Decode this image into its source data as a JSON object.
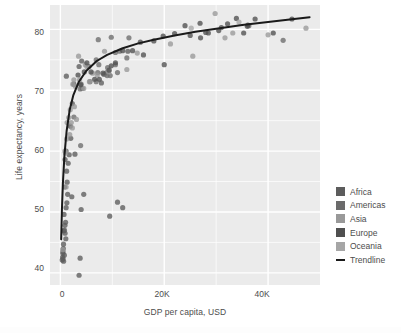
{
  "chart_data": {
    "type": "scatter",
    "title": "",
    "xlabel": "GDP per capita, USD",
    "ylabel": "Life expectancy, years",
    "xlim": [
      -2000,
      50000
    ],
    "ylim": [
      38,
      84
    ],
    "xticks": [
      "0",
      "20K",
      "40K"
    ],
    "xtickvalues": [
      0,
      20000,
      40000
    ],
    "yticks": [
      "40",
      "50",
      "60",
      "70",
      "80"
    ],
    "ytickvalues": [
      40,
      50,
      60,
      70,
      80
    ],
    "grid": true,
    "legend_position": "right",
    "panel_background": "#ebebeb",
    "gridline_color": "#ffffff",
    "point_color": "#595959",
    "trendline_color": "#1a1a1a",
    "series": [
      {
        "name": "Africa",
        "color": "#5c5c5c",
        "points": [
          [
            1150,
            72.3
          ],
          [
            3600,
            73.9
          ],
          [
            1200,
            56.7
          ],
          [
            1100,
            50.7
          ],
          [
            1400,
            52.9
          ],
          [
            900,
            46.5
          ],
          [
            4000,
            50.4
          ],
          [
            2200,
            52.5
          ],
          [
            700,
            49.6
          ],
          [
            600,
            44.7
          ],
          [
            1000,
            48.3
          ],
          [
            820,
            54.1
          ],
          [
            430,
            42.6
          ],
          [
            1500,
            58.0
          ],
          [
            640,
            46.9
          ],
          [
            350,
            42.1
          ],
          [
            500,
            43.5
          ],
          [
            1700,
            59.4
          ],
          [
            12000,
            50.7
          ],
          [
            11000,
            51.6
          ],
          [
            2800,
            59.5
          ],
          [
            9500,
            49.3
          ],
          [
            3800,
            42.4
          ],
          [
            3600,
            39.6
          ],
          [
            1900,
            64.1
          ],
          [
            2000,
            62.1
          ],
          [
            4500,
            52.9
          ],
          [
            1300,
            54.9
          ],
          [
            780,
            47.0
          ],
          [
            470,
            43.2
          ],
          [
            620,
            41.9
          ],
          [
            5500,
            73.9
          ],
          [
            7900,
            71.2
          ],
          [
            2600,
            71.0
          ],
          [
            4100,
            74.8
          ],
          [
            13000,
            76.4
          ],
          [
            2300,
            67.8
          ],
          [
            900,
            58.6
          ],
          [
            1100,
            60.0
          ],
          [
            1250,
            51.5
          ],
          [
            560,
            44.0
          ],
          [
            760,
            42.9
          ],
          [
            1050,
            45.6
          ],
          [
            520,
            42.3
          ],
          [
            880,
            47.8
          ]
        ]
      },
      {
        "name": "Americas",
        "color": "#6b6b6b",
        "points": [
          [
            12800,
            75.3
          ],
          [
            9000,
            72.4
          ],
          [
            9600,
            72.4
          ],
          [
            36300,
            80.6
          ],
          [
            13200,
            78.6
          ],
          [
            8900,
            72.9
          ],
          [
            7300,
            78.3
          ],
          [
            11000,
            72.9
          ],
          [
            6900,
            75.0
          ],
          [
            5700,
            71.4
          ],
          [
            4200,
            70.3
          ],
          [
            8400,
            72.6
          ],
          [
            7400,
            74.2
          ],
          [
            4000,
            71.0
          ],
          [
            3800,
            70.2
          ],
          [
            3900,
            60.9
          ],
          [
            7200,
            72.9
          ],
          [
            10600,
            76.2
          ],
          [
            2600,
            65.6
          ],
          [
            6900,
            71.4
          ],
          [
            9800,
            78.7
          ],
          [
            42900,
            78.2
          ],
          [
            11400,
            76.4
          ],
          [
            9100,
            73.7
          ],
          [
            10600,
            74.2
          ]
        ]
      },
      {
        "name": "Asia",
        "color": "#999999",
        "points": [
          [
            29800,
            82.6
          ],
          [
            31700,
            78.6
          ],
          [
            47300,
            80.2
          ],
          [
            33200,
            79.4
          ],
          [
            12800,
            73.4
          ],
          [
            2600,
            71.7
          ],
          [
            2100,
            64.7
          ],
          [
            3100,
            65.2
          ],
          [
            4500,
            70.3
          ],
          [
            2300,
            63.8
          ],
          [
            1800,
            62.7
          ],
          [
            1600,
            65.5
          ],
          [
            1300,
            64.7
          ],
          [
            980,
            59.7
          ],
          [
            870,
            60.0
          ],
          [
            3700,
            71.7
          ],
          [
            7100,
            72.5
          ],
          [
            5600,
            71.4
          ],
          [
            2900,
            70.6
          ],
          [
            9300,
            73.0
          ],
          [
            40000,
            79.1
          ],
          [
            25500,
            75.6
          ],
          [
            21200,
            77.6
          ],
          [
            6200,
            72.8
          ],
          [
            2700,
            67.3
          ],
          [
            1200,
            62.0
          ],
          [
            1100,
            54.1
          ],
          [
            450,
            43.8
          ],
          [
            3500,
            75.6
          ],
          [
            8500,
            76.4
          ],
          [
            4800,
            74.2
          ],
          [
            1900,
            66.8
          ],
          [
            2400,
            71.0
          ],
          [
            5100,
            73.9
          ],
          [
            14800,
            76.1
          ]
        ]
      },
      {
        "name": "Europe",
        "color": "#4f4f4f",
        "points": [
          [
            33900,
            81.8
          ],
          [
            36100,
            80.7
          ],
          [
            35300,
            79.4
          ],
          [
            32200,
            80.9
          ],
          [
            30500,
            79.8
          ],
          [
            28500,
            79.4
          ],
          [
            26900,
            81.0
          ],
          [
            24000,
            80.6
          ],
          [
            22000,
            79.3
          ],
          [
            19800,
            78.9
          ],
          [
            18000,
            78.1
          ],
          [
            15400,
            77.9
          ],
          [
            13900,
            76.5
          ],
          [
            12000,
            76.5
          ],
          [
            10600,
            74.5
          ],
          [
            9800,
            74.0
          ],
          [
            9400,
            73.3
          ],
          [
            8200,
            72.8
          ],
          [
            7500,
            71.8
          ],
          [
            6600,
            71.8
          ],
          [
            5900,
            73.0
          ],
          [
            5100,
            74.5
          ],
          [
            4600,
            73.0
          ],
          [
            3900,
            70.9
          ],
          [
            3400,
            72.5
          ],
          [
            44600,
            81.7
          ],
          [
            41000,
            79.4
          ],
          [
            37500,
            81.7
          ],
          [
            36000,
            80.5
          ],
          [
            25000,
            79.0
          ],
          [
            28000,
            79.5
          ],
          [
            31000,
            80.3
          ],
          [
            27000,
            78.6
          ],
          [
            20000,
            74.2
          ],
          [
            16000,
            75.8
          ]
        ]
      },
      {
        "name": "Oceania",
        "color": "#a6a6a6",
        "points": [
          [
            34400,
            81.2
          ],
          [
            25200,
            80.2
          ]
        ]
      }
    ],
    "trendline": {
      "name": "Trendline",
      "description": "Logarithmic best-fit of life expectancy vs GDP per capita",
      "points": [
        [
          150,
          45.5
        ],
        [
          300,
          50.5
        ],
        [
          500,
          55.0
        ],
        [
          800,
          59.5
        ],
        [
          1200,
          63.3
        ],
        [
          1800,
          66.8
        ],
        [
          2500,
          69.2
        ],
        [
          3500,
          71.3
        ],
        [
          5000,
          73.2
        ],
        [
          7000,
          74.8
        ],
        [
          9000,
          75.8
        ],
        [
          12000,
          76.9
        ],
        [
          15000,
          77.7
        ],
        [
          18000,
          78.3
        ],
        [
          22000,
          79.0
        ],
        [
          26000,
          79.6
        ],
        [
          30000,
          80.1
        ],
        [
          35000,
          80.7
        ],
        [
          40000,
          81.2
        ],
        [
          45000,
          81.7
        ],
        [
          48000,
          82.0
        ]
      ]
    }
  },
  "axes": {
    "y_title": "Life expectancy, years",
    "x_title": "GDP per capita, USD",
    "y_ticks": [
      "80",
      "70",
      "60",
      "50",
      "40"
    ],
    "x_ticks": [
      "0",
      "20K",
      "40K"
    ]
  },
  "legend": {
    "items": [
      {
        "label": "Africa",
        "color": "#5c5c5c",
        "kind": "swatch"
      },
      {
        "label": "Americas",
        "color": "#6b6b6b",
        "kind": "swatch"
      },
      {
        "label": "Asia",
        "color": "#999999",
        "kind": "swatch"
      },
      {
        "label": "Europe",
        "color": "#4f4f4f",
        "kind": "swatch"
      },
      {
        "label": "Oceania",
        "color": "#a6a6a6",
        "kind": "swatch"
      },
      {
        "label": "Trendline",
        "color": "#1a1a1a",
        "kind": "line"
      }
    ]
  }
}
